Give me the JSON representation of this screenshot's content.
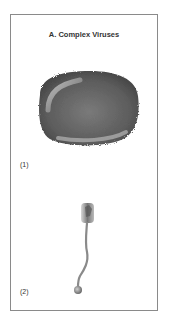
{
  "panel": {
    "title": "A. Complex Viruses",
    "items": [
      {
        "label": "(1)",
        "description": "Poxvirus-like brick/oval virion with bumpy surface"
      },
      {
        "label": "(2)",
        "description": "Bacteriophage-like virion with head, long wavy tail and terminal knob"
      }
    ]
  },
  "colors": {
    "border": "#8a8a8a",
    "text": "#333333",
    "virus_dark": "#555555",
    "virus_light": "#b8b8b8"
  }
}
